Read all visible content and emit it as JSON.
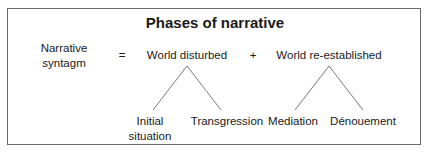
{
  "title": "Phases of narrative",
  "left_label": {
    "line1": "Narrative",
    "line2": "syntagm"
  },
  "operators": {
    "equals": "=",
    "plus": "+"
  },
  "nodes": {
    "world_disturbed": {
      "label": "World disturbed",
      "children": [
        {
          "line1": "Initial",
          "line2": "situation"
        },
        {
          "line1": "Transgression"
        }
      ]
    },
    "world_reestablished": {
      "label": "World re-established",
      "children": [
        {
          "line1": "Mediation"
        },
        {
          "line1": "Dénouement"
        }
      ]
    }
  },
  "colors": {
    "border": "#6a6a6a",
    "lines": "#7a7a7a",
    "text": "#1a1a1a"
  }
}
